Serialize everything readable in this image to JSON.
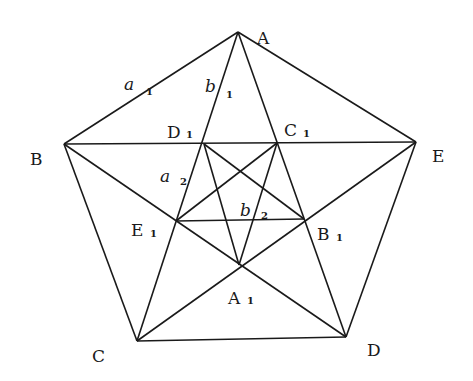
{
  "diagram": {
    "title": "",
    "points": {
      "A": {
        "label": "A",
        "sub": "",
        "x": 238,
        "y": 32
      },
      "B": {
        "label": "B",
        "sub": "",
        "x": 64,
        "y": 144
      },
      "C": {
        "label": "C",
        "sub": "",
        "x": 137,
        "y": 341
      },
      "D": {
        "label": "D",
        "sub": "",
        "x": 346,
        "y": 337
      },
      "E": {
        "label": "E",
        "sub": "",
        "x": 416,
        "y": 142
      },
      "A1": {
        "label": "A",
        "sub": "1",
        "x": 239,
        "y": 265
      },
      "B1": {
        "label": "B",
        "sub": "1",
        "x": 304,
        "y": 219
      },
      "C1": {
        "label": "C",
        "sub": "1",
        "x": 277,
        "y": 143
      },
      "D1": {
        "label": "D",
        "sub": "1",
        "x": 204,
        "y": 144
      },
      "E1": {
        "label": "E",
        "sub": "1",
        "x": 176,
        "y": 221
      }
    },
    "segment_labels": {
      "a1": {
        "letter": "a",
        "sub": "1"
      },
      "b1": {
        "letter": "b",
        "sub": "1"
      },
      "a2": {
        "letter": "a",
        "sub": "2"
      },
      "b2": {
        "letter": "b",
        "sub": "2"
      }
    },
    "edges": [
      [
        "A",
        "B"
      ],
      [
        "B",
        "C"
      ],
      [
        "C",
        "D"
      ],
      [
        "D",
        "E"
      ],
      [
        "E",
        "A"
      ],
      [
        "A",
        "C"
      ],
      [
        "A",
        "D"
      ],
      [
        "B",
        "E"
      ],
      [
        "B",
        "D"
      ],
      [
        "C",
        "E"
      ],
      [
        "D1",
        "A1"
      ],
      [
        "C1",
        "A1"
      ],
      [
        "E1",
        "B1"
      ],
      [
        "D1",
        "B1"
      ],
      [
        "C1",
        "E1"
      ]
    ],
    "stroke_color": "#1a1a1a",
    "background": "#ffffff"
  }
}
